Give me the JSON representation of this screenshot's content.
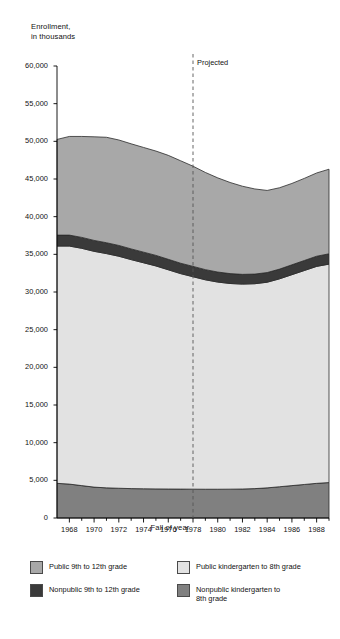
{
  "title_lines": "Enrollment,\nin thousands",
  "xlabel": "Fall of year",
  "projected_label": "Projected",
  "legend": {
    "public_9_12": "Public 9th to 12th grade",
    "nonpublic_9_12": "Nonpublic 9th to 12th grade",
    "public_k_8": "Public kindergarten to 8th grade",
    "nonpublic_k_8": "Nonpublic kindergarten to\n8th grade"
  },
  "colors": {
    "public_9_12": "#a8a8a8",
    "nonpublic_9_12": "#3a3a3a",
    "public_k_8": "#e2e2e2",
    "nonpublic_k_8": "#808080",
    "axis": "#000000",
    "projected_line": "#555555"
  },
  "yticks": [
    "0",
    "5,000",
    "10,000",
    "15,000",
    "20,000",
    "25,000",
    "30,000",
    "35,000",
    "40,000",
    "45,000",
    "50,000",
    "55,000",
    "60,000"
  ],
  "xticks": [
    "1968",
    "1970",
    "1972",
    "1974",
    "1976",
    "1978",
    "1980",
    "1982",
    "1984",
    "1986",
    "1988"
  ],
  "chart_data": {
    "type": "area",
    "title": "Enrollment, in thousands",
    "xlabel": "Fall of year",
    "ylabel": "Enrollment, in thousands",
    "ylim": [
      0,
      60000
    ],
    "xlim": [
      1967,
      1989
    ],
    "ytick_step": 5000,
    "xtick_step": 2,
    "grid": false,
    "legend_position": "bottom",
    "stacked": true,
    "annotations": [
      {
        "text": "Projected",
        "x": 1978,
        "type": "vertical-dashed-line"
      }
    ],
    "x": [
      1967,
      1968,
      1969,
      1970,
      1971,
      1972,
      1973,
      1974,
      1975,
      1976,
      1977,
      1978,
      1979,
      1980,
      1981,
      1982,
      1983,
      1984,
      1985,
      1986,
      1987,
      1988,
      1989
    ],
    "series": [
      {
        "name": "Nonpublic kindergarten to 8th grade",
        "color": "#808080",
        "values": [
          4600,
          4500,
          4300,
          4100,
          4000,
          3950,
          3900,
          3880,
          3860,
          3850,
          3840,
          3830,
          3820,
          3820,
          3830,
          3850,
          3900,
          4000,
          4150,
          4300,
          4450,
          4600,
          4700
        ]
      },
      {
        "name": "Public kindergarten to 8th grade",
        "color": "#e2e2e2",
        "values": [
          31500,
          31600,
          31500,
          31300,
          31100,
          30800,
          30400,
          30000,
          29600,
          29100,
          28600,
          28200,
          27800,
          27500,
          27300,
          27200,
          27200,
          27300,
          27600,
          28000,
          28400,
          28800,
          29000
        ]
      },
      {
        "name": "Nonpublic 9th to 12th grade",
        "color": "#3a3a3a",
        "values": [
          1450,
          1450,
          1450,
          1450,
          1440,
          1430,
          1420,
          1410,
          1400,
          1390,
          1380,
          1370,
          1350,
          1330,
          1310,
          1290,
          1280,
          1280,
          1290,
          1310,
          1330,
          1350,
          1370
        ]
      },
      {
        "name": "Public 9th to 12th grade",
        "color": "#a8a8a8",
        "values": [
          12700,
          13100,
          13400,
          13750,
          14000,
          14000,
          13950,
          13900,
          13850,
          13800,
          13600,
          13300,
          12900,
          12500,
          12100,
          11700,
          11300,
          10900,
          10800,
          10800,
          10900,
          11050,
          11230
        ]
      }
    ],
    "totals": [
      50250,
      50650,
      50650,
      50600,
      50540,
      50180,
      49670,
      49190,
      48710,
      48140,
      47420,
      46700,
      45870,
      45150,
      44540,
      44040,
      43680,
      43480,
      43840,
      44410,
      45080,
      45800,
      46300
    ]
  }
}
